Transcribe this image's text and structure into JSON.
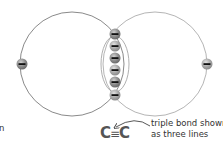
{
  "diagram": {
    "atoms": [
      {
        "id": "left-carbon",
        "cx": 72,
        "cy": 64,
        "r": 52,
        "stroke": "#8a8a8a"
      },
      {
        "id": "right-carbon",
        "cx": 155,
        "cy": 64,
        "r": 52,
        "stroke": "#b5b5b5"
      }
    ],
    "electron_symbol": "−",
    "electrons": [
      {
        "id": "left-outer",
        "x": 22,
        "y": 64
      },
      {
        "id": "right-outer",
        "x": 207,
        "y": 64
      },
      {
        "id": "shared-top",
        "x": 115,
        "y": 34
      },
      {
        "id": "bond-1",
        "x": 115,
        "y": 46
      },
      {
        "id": "bond-2",
        "x": 115,
        "y": 58
      },
      {
        "id": "bond-3",
        "x": 115,
        "y": 70
      },
      {
        "id": "bond-4",
        "x": 115,
        "y": 82
      },
      {
        "id": "shared-bottom",
        "x": 115,
        "y": 95
      }
    ],
    "bond_region": {
      "cx": 115,
      "cy": 64,
      "rx": 14,
      "ry": 28
    },
    "colors": {
      "electron_fill": "#7a7a7a",
      "electron_highlight": "#c8c8c8",
      "electron_dash": "#111111",
      "text": "#333333",
      "formula": "#555555"
    },
    "formula": {
      "left": "C",
      "bond": "≡",
      "right": "C"
    },
    "annotation": {
      "line1": "triple bond shown",
      "line2": "as three lines"
    },
    "cut_off_left_label": "n"
  }
}
